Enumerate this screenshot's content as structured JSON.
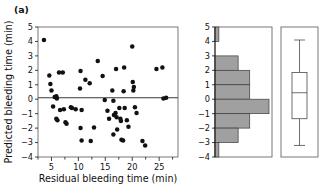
{
  "figure": {
    "panel_label": "(a)",
    "background": "#ffffff",
    "point_color": "#111111",
    "bar_fill": "#a0a0a0",
    "bar_stroke": "#3c3c3c"
  },
  "chart_data": [
    {
      "type": "scatter",
      "title": "",
      "xlabel": "Residual bleeding time (min)",
      "ylabel": "Predicted bleeding time (min)",
      "xlim": [
        2.5,
        28.5
      ],
      "ylim": [
        -4,
        5
      ],
      "xticks": [
        5,
        10,
        15,
        20,
        25
      ],
      "xtick_labels": [
        "5",
        "10",
        "15",
        "20",
        "25"
      ],
      "xminor_ticks": [
        2.5,
        7.5,
        12.5,
        17.5,
        22.5,
        27.5
      ],
      "yticks": [
        5,
        4,
        3,
        2,
        1,
        0,
        -1,
        -2,
        -3,
        -4
      ],
      "ytick_labels": [
        "5",
        "4",
        "3",
        "2",
        "1",
        "0",
        "−1",
        "−2",
        "−3",
        "−4"
      ],
      "grid": false,
      "legend": "none",
      "reference_line": {
        "orientation": "horizontal",
        "y": 0.1,
        "label": ""
      },
      "points": [
        [
          3.6,
          4.1
        ],
        [
          4.6,
          1.65
        ],
        [
          4.8,
          1.05
        ],
        [
          5.0,
          0.6
        ],
        [
          5.3,
          -0.5
        ],
        [
          5.6,
          0.15
        ],
        [
          5.9,
          0.2
        ],
        [
          6.0,
          0.05
        ],
        [
          5.9,
          -1.35
        ],
        [
          6.1,
          -1.45
        ],
        [
          6.4,
          1.85
        ],
        [
          6.6,
          -0.75
        ],
        [
          7.1,
          1.85
        ],
        [
          7.3,
          -0.7
        ],
        [
          7.6,
          -1.6
        ],
        [
          7.8,
          -1.7
        ],
        [
          8.6,
          -0.55
        ],
        [
          8.8,
          -0.6
        ],
        [
          9.5,
          -0.7
        ],
        [
          10.4,
          1.95
        ],
        [
          10.3,
          0.75
        ],
        [
          10.6,
          -0.75
        ],
        [
          10.4,
          -2.0
        ],
        [
          10.6,
          -2.85
        ],
        [
          11.3,
          1.35
        ],
        [
          12.1,
          1.1
        ],
        [
          12.3,
          -2.9
        ],
        [
          12.9,
          -1.95
        ],
        [
          13.6,
          2.65
        ],
        [
          14.5,
          1.6
        ],
        [
          14.9,
          -0.05
        ],
        [
          15.4,
          -0.8
        ],
        [
          15.7,
          -1.35
        ],
        [
          16.3,
          0.6
        ],
        [
          16.5,
          -0.1
        ],
        [
          16.6,
          -1.1
        ],
        [
          16.5,
          -2.45
        ],
        [
          16.9,
          -0.95
        ],
        [
          17.1,
          -1.25
        ],
        [
          17.2,
          -2.1
        ],
        [
          17.0,
          2.1
        ],
        [
          17.6,
          -0.6
        ],
        [
          17.8,
          -1.35
        ],
        [
          17.9,
          -1.5
        ],
        [
          18.0,
          -2.8
        ],
        [
          18.3,
          -2.85
        ],
        [
          18.5,
          2.2
        ],
        [
          18.4,
          0.55
        ],
        [
          18.6,
          -0.6
        ],
        [
          19.0,
          -1.45
        ],
        [
          19.3,
          -1.9
        ],
        [
          20.0,
          3.65
        ],
        [
          20.1,
          1.2
        ],
        [
          20.3,
          0.85
        ],
        [
          20.2,
          0.6
        ],
        [
          20.5,
          -0.55
        ],
        [
          20.8,
          -0.95
        ],
        [
          21.9,
          -2.9
        ],
        [
          22.4,
          -3.2
        ],
        [
          24.5,
          2.1
        ],
        [
          25.6,
          2.2
        ],
        [
          25.8,
          0.05
        ],
        [
          26.3,
          0.1
        ]
      ]
    },
    {
      "type": "bar",
      "orientation": "horizontal",
      "title": "",
      "xlabel": "",
      "ylabel": "",
      "ylim": [
        -4,
        5
      ],
      "yticks": [
        5,
        4,
        3,
        2,
        1,
        0,
        -1,
        -2,
        -3,
        -4
      ],
      "ytick_labels": [
        "5",
        "4",
        "3",
        "2",
        "1",
        "0",
        "−1",
        "−2",
        "−3",
        "−4"
      ],
      "grid": false,
      "legend": "none",
      "bin_edges": [
        5,
        4,
        3,
        2,
        1,
        0,
        -1,
        -2,
        -3,
        -4
      ],
      "bin_labels": [
        "4 to 5",
        "3 to 4",
        "2 to 3",
        "1 to 2",
        "0 to 1",
        "-1 to 0",
        "-2 to -1",
        "-3 to -2",
        "-4 to -3"
      ],
      "counts": [
        1,
        0,
        6,
        9,
        9,
        14,
        9,
        6,
        1
      ],
      "count_max": 14
    },
    {
      "type": "box",
      "title": "",
      "xlabel": "",
      "ylabel": "",
      "ylim": [
        -4,
        5
      ],
      "grid": false,
      "legend": "none",
      "boxes": [
        {
          "label": "",
          "whisker_low": -3.2,
          "q1": -1.35,
          "median": 0.45,
          "q3": 1.85,
          "whisker_high": 4.1
        }
      ]
    }
  ]
}
